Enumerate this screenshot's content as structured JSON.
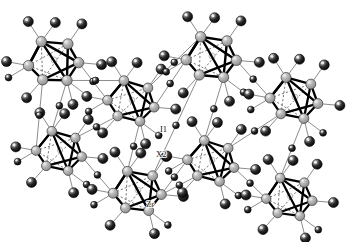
{
  "figure": {
    "kind": "crystal-structure-diagram",
    "background_color": "#ffffff"
  },
  "legend_labels": [
    {
      "id": "i1",
      "text": "I1",
      "x": 160,
      "y": 132
    },
    {
      "id": "x2",
      "text": "X2",
      "x": 156,
      "y": 157
    },
    {
      "id": "zr",
      "text": "Zr",
      "x": 146,
      "y": 207
    }
  ],
  "colors": {
    "metal_sphere": "#9a9a9a",
    "metal_sphere_edge": "#3a3a3a",
    "metal_highlight": "#e8e8e8",
    "halide_sphere": "#1c1c1c",
    "halide_sphere_edge": "#000000",
    "halide_highlight": "#f2f2f2",
    "interstitial": "#f5f5f5",
    "cluster_bond": "#000000",
    "hidden_bond": "#555555",
    "bridge_bond": "#6e6e6e",
    "label_text": "#111111"
  },
  "geometry": {
    "sphere_radius_metal": 5.2,
    "sphere_radius_halide": 5.0,
    "sphere_radius_halide_small": 3.4,
    "interstitial_radius": 3.0,
    "cluster_bond_width": 2.4,
    "bridge_bond_width": 0.8
  },
  "clusters": [
    {
      "id": "c1",
      "cx": 54,
      "cy": 60,
      "scale": 1.0,
      "rot": -8
    },
    {
      "id": "c2",
      "cx": 132,
      "cy": 100,
      "scale": 0.94,
      "rot": 4
    },
    {
      "id": "c3",
      "cx": 212,
      "cy": 56,
      "scale": 1.0,
      "rot": -4
    },
    {
      "id": "c4",
      "cx": 295,
      "cy": 97,
      "scale": 0.96,
      "rot": 2
    },
    {
      "id": "c5",
      "cx": 60,
      "cy": 150,
      "scale": 0.92,
      "rot": 3
    },
    {
      "id": "c6",
      "cx": 138,
      "cy": 190,
      "scale": 0.96,
      "rot": -3
    },
    {
      "id": "c7",
      "cx": 212,
      "cy": 160,
      "scale": 0.94,
      "rot": 5
    },
    {
      "id": "c8",
      "cx": 290,
      "cy": 196,
      "scale": 0.92,
      "rot": -2
    }
  ],
  "chart_data": {
    "type": "diagram",
    "node_types": [
      {
        "name": "Zr",
        "role": "octahedron vertex metal atom",
        "render": "light gray shaded sphere"
      },
      {
        "name": "I1",
        "role": "bridging halide between clusters",
        "render": "black shaded sphere"
      },
      {
        "name": "X2",
        "role": "small bridging/interstitial halide site",
        "render": "small black sphere"
      }
    ],
    "cluster_count": 8,
    "vertices_per_cluster": 6,
    "bond_styles": [
      {
        "name": "metal-metal",
        "render": "thick solid black line"
      },
      {
        "name": "hidden metal-metal",
        "render": "thin dashed gray line"
      },
      {
        "name": "metal-halide",
        "render": "thin solid gray line"
      }
    ]
  }
}
